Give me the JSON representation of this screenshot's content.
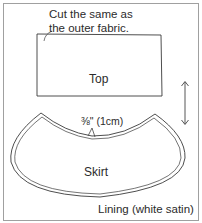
{
  "diagram": {
    "type": "sewing-pattern-pieces",
    "fabric_label": "Lining (white satin)",
    "note": {
      "line1": "Cut the same as",
      "line2": "the outer fabric."
    },
    "pieces": [
      {
        "id": "top",
        "label": "Top",
        "shape": "rectangle"
      },
      {
        "id": "skirt",
        "label": "Skirt",
        "shape": "curved-arc-band"
      }
    ],
    "seam_allowance": "⅜\" (1cm)",
    "grain_line": "double-headed vertical arrow",
    "colors": {
      "line": "#3a3a3a",
      "frame": "#9a9a9a",
      "background": "#ffffff"
    }
  }
}
